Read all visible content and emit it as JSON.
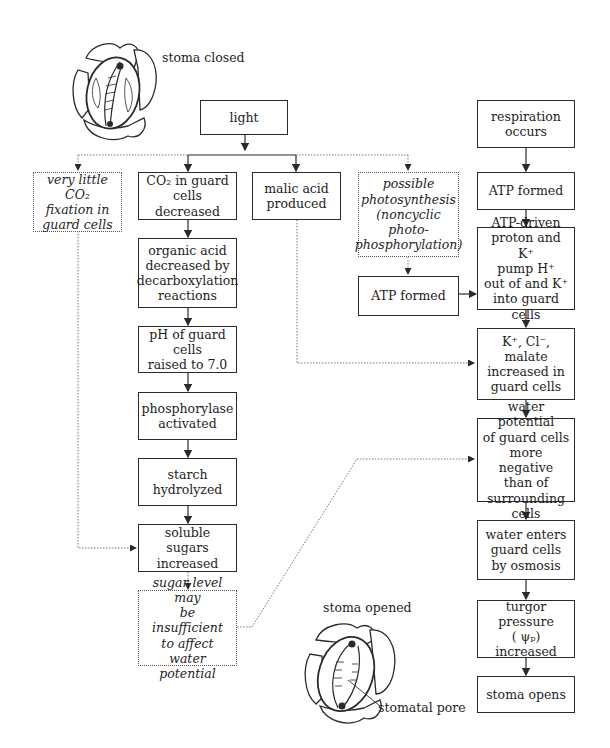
{
  "diagram": {
    "type": "flowchart",
    "topic": "Mechanism of stomatal opening in response to light",
    "illustrations": {
      "stoma_closed_label": "stoma closed",
      "stoma_opened_label": "stoma opened",
      "stomatal_pore_label": "stomatal pore"
    },
    "nodes": {
      "light": "light",
      "co2_fixation": "very little CO₂\nfixation in\nguard cells",
      "co2_decreased": "CO₂ in guard\ncells decreased",
      "malic_acid": "malic acid\nproduced",
      "photosynthesis": "possible\nphotosynthesis\n(noncyclic\nphoto-\nphosphorylation)",
      "organic_acid": "organic acid\ndecreased by\ndecarboxylation\nreactions",
      "ph_raised": "pH of guard cells\nraised to 7.0",
      "phosphorylase": "phosphorylase\nactivated",
      "starch": "starch\nhydrolyzed",
      "soluble_sugars": "soluble sugars\nincreased",
      "sugar_level": "sugar level may\nbe insufficient\nto affect\nwater potential",
      "atp_formed_mid": "ATP formed",
      "respiration": "respiration\noccurs",
      "atp_formed_right": "ATP formed",
      "atp_pump": "ATP-driven\nproton and K⁺\npump H⁺\nout of and K⁺\ninto guard cells",
      "ions_increased": "K⁺, Cl⁻,\nmalate\nincreased in\nguard cells",
      "water_potential": "water potential\nof guard cells\nmore negative\nthan of\nsurrounding cells",
      "water_enters": "water enters\nguard cells\nby osmosis",
      "turgor": "turgor pressure\n( ψₚ)\nincreased",
      "stoma_opens": "stoma opens"
    },
    "edges": [
      {
        "from": "light",
        "to": "co2_fixation",
        "style": "dotted"
      },
      {
        "from": "light",
        "to": "co2_decreased",
        "style": "solid"
      },
      {
        "from": "light",
        "to": "malic_acid",
        "style": "solid"
      },
      {
        "from": "light",
        "to": "photosynthesis",
        "style": "dotted"
      },
      {
        "from": "co2_decreased",
        "to": "organic_acid",
        "style": "solid"
      },
      {
        "from": "organic_acid",
        "to": "ph_raised",
        "style": "solid"
      },
      {
        "from": "ph_raised",
        "to": "phosphorylase",
        "style": "solid"
      },
      {
        "from": "phosphorylase",
        "to": "starch",
        "style": "solid"
      },
      {
        "from": "starch",
        "to": "soluble_sugars",
        "style": "solid"
      },
      {
        "from": "co2_fixation",
        "to": "soluble_sugars",
        "style": "dotted"
      },
      {
        "from": "soluble_sugars",
        "to": "sugar_level",
        "style": "dotted"
      },
      {
        "from": "sugar_level",
        "to": "water_potential",
        "style": "dotted"
      },
      {
        "from": "malic_acid",
        "to": "ions_increased",
        "style": "dotted"
      },
      {
        "from": "photosynthesis",
        "to": "atp_formed_mid",
        "style": "dotted"
      },
      {
        "from": "atp_formed_mid",
        "to": "atp_pump",
        "style": "solid"
      },
      {
        "from": "respiration",
        "to": "atp_formed_right",
        "style": "solid"
      },
      {
        "from": "atp_formed_right",
        "to": "atp_pump",
        "style": "solid"
      },
      {
        "from": "atp_pump",
        "to": "ions_increased",
        "style": "solid"
      },
      {
        "from": "ions_increased",
        "to": "water_potential",
        "style": "solid"
      },
      {
        "from": "water_potential",
        "to": "water_enters",
        "style": "solid"
      },
      {
        "from": "water_enters",
        "to": "turgor",
        "style": "solid"
      },
      {
        "from": "turgor",
        "to": "stoma_opens",
        "style": "solid"
      }
    ]
  }
}
